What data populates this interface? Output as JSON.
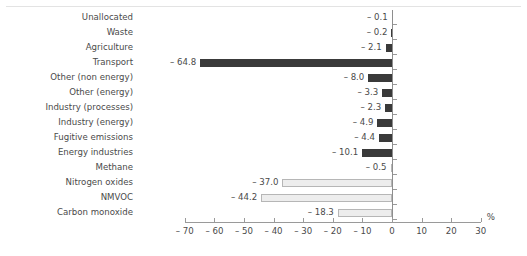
{
  "chart_data": {
    "type": "bar",
    "orientation": "horizontal",
    "title": "",
    "xlabel": "%",
    "ylabel": "",
    "xlim": [
      -70,
      30
    ],
    "xticks": [
      -70,
      -60,
      -50,
      -40,
      -30,
      -20,
      -10,
      0,
      10,
      20,
      30
    ],
    "xtick_labels": [
      "– 70",
      "– 60",
      "– 50",
      "– 40",
      "– 30",
      "– 20",
      "– 10",
      "0",
      "10",
      "20",
      "30"
    ],
    "grid": false,
    "legend": null,
    "categories": [
      "Unallocated",
      "Waste",
      "Agriculture",
      "Transport",
      "Other (non energy)",
      "Other (energy)",
      "Industry (processes)",
      "Industry (energy)",
      "Fugitive emissions",
      "Energy industries",
      "Methane",
      "Nitrogen oxides",
      "NMVOC",
      "Carbon monoxide"
    ],
    "values": [
      -0.1,
      -0.2,
      -2.1,
      -64.8,
      -8.0,
      -3.3,
      -2.3,
      -4.9,
      -4.4,
      -10.1,
      -0.5,
      -37.0,
      -44.2,
      -18.3
    ],
    "value_labels": [
      "– 0.1",
      "– 0.2",
      "– 2.1",
      "– 64.8",
      "– 8.0",
      "– 3.3",
      "– 2.3",
      "– 4.9",
      "– 4.4",
      "– 10.1",
      "– 0.5",
      "– 37.0",
      "– 44.2",
      "– 18.3"
    ],
    "bar_styles": [
      "dark",
      "dark",
      "dark",
      "dark",
      "dark",
      "dark",
      "dark",
      "dark",
      "dark",
      "dark",
      "light",
      "light",
      "light",
      "light"
    ],
    "colors": {
      "dark_bar": "#3a3a3a",
      "light_bar_fill": "#ededed",
      "light_bar_border": "#b6b6b6",
      "axis": "#9a9a9a",
      "text": "#4a4a4a"
    }
  }
}
